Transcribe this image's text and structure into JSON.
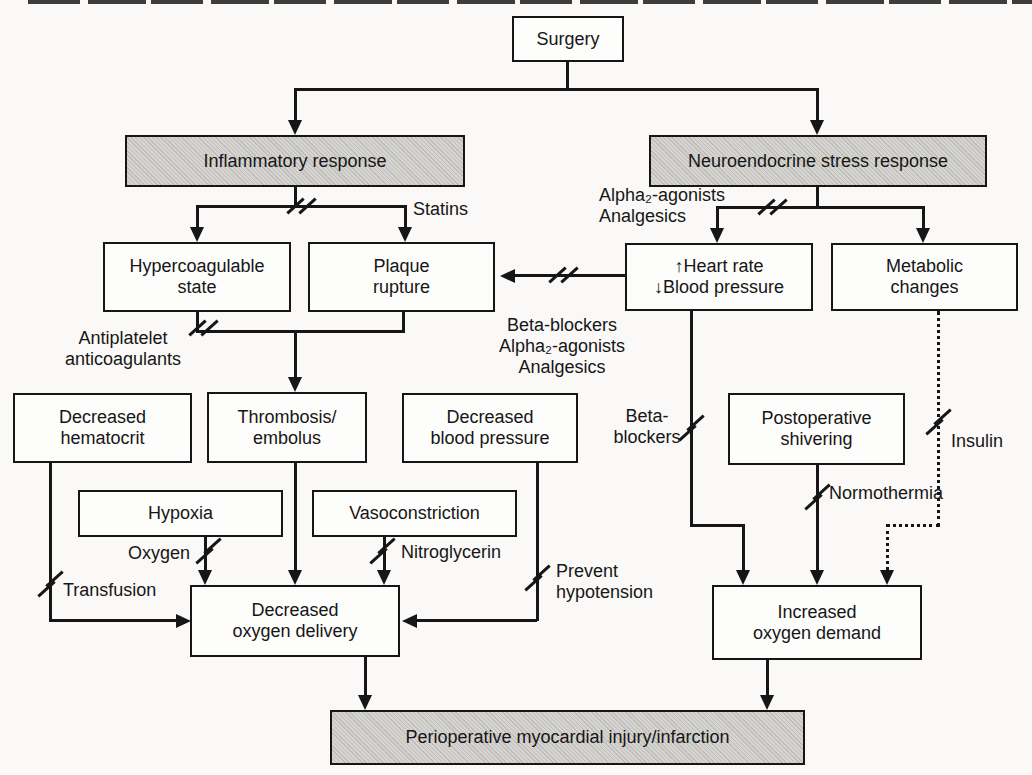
{
  "figure": {
    "type": "flowchart",
    "topic": "Pathways from surgery to perioperative myocardial injury/infarction with interventions",
    "colors": {
      "background": "#faf9f7",
      "line": "#161616",
      "plain_box_fill": "#fdfdfc",
      "shaded_box_fill": "#d5d4d1"
    }
  },
  "nodes": [
    {
      "id": "surgery",
      "lines": [
        "Surgery"
      ],
      "x": 512,
      "y": 16,
      "w": 112,
      "h": 46,
      "shaded": false
    },
    {
      "id": "inflammatory-response",
      "lines": [
        "Inflammatory response"
      ],
      "x": 125,
      "y": 135,
      "w": 340,
      "h": 52,
      "shaded": true
    },
    {
      "id": "neuroendocrine-stress-response",
      "lines": [
        "Neuroendocrine stress response"
      ],
      "x": 649,
      "y": 135,
      "w": 338,
      "h": 52,
      "shaded": true
    },
    {
      "id": "hypercoagulable-state",
      "lines": [
        "Hypercoagulable",
        "state"
      ],
      "x": 103,
      "y": 242,
      "w": 188,
      "h": 70,
      "shaded": false
    },
    {
      "id": "plaque-rupture",
      "lines": [
        "Plaque",
        "rupture"
      ],
      "x": 308,
      "y": 242,
      "w": 187,
      "h": 70,
      "shaded": false
    },
    {
      "id": "heart-rate-blood-pressure",
      "lines": [
        "↑Heart rate",
        "↓Blood pressure"
      ],
      "x": 625,
      "y": 243,
      "w": 188,
      "h": 68,
      "shaded": false
    },
    {
      "id": "metabolic-changes",
      "lines": [
        "Metabolic",
        "changes"
      ],
      "x": 831,
      "y": 243,
      "w": 187,
      "h": 68,
      "shaded": false
    },
    {
      "id": "decreased-hematocrit",
      "lines": [
        "Decreased",
        "hematocrit"
      ],
      "x": 13,
      "y": 393,
      "w": 179,
      "h": 70,
      "shaded": false
    },
    {
      "id": "thrombosis-embolus",
      "lines": [
        "Thrombosis/",
        "embolus"
      ],
      "x": 207,
      "y": 392,
      "w": 160,
      "h": 71,
      "shaded": false
    },
    {
      "id": "decreased-blood-pressure",
      "lines": [
        "Decreased",
        "blood pressure"
      ],
      "x": 402,
      "y": 393,
      "w": 176,
      "h": 70,
      "shaded": false
    },
    {
      "id": "postoperative-shivering",
      "lines": [
        "Postoperative",
        "shivering"
      ],
      "x": 728,
      "y": 393,
      "w": 177,
      "h": 72,
      "shaded": false
    },
    {
      "id": "hypoxia",
      "lines": [
        "Hypoxia"
      ],
      "x": 78,
      "y": 490,
      "w": 205,
      "h": 47,
      "shaded": false
    },
    {
      "id": "vasoconstriction",
      "lines": [
        "Vasoconstriction"
      ],
      "x": 312,
      "y": 490,
      "w": 205,
      "h": 47,
      "shaded": false
    },
    {
      "id": "decreased-oxygen-delivery",
      "lines": [
        "Decreased",
        "oxygen delivery"
      ],
      "x": 190,
      "y": 585,
      "w": 210,
      "h": 72,
      "shaded": false
    },
    {
      "id": "increased-oxygen-demand",
      "lines": [
        "Increased",
        "oxygen demand"
      ],
      "x": 712,
      "y": 585,
      "w": 210,
      "h": 75,
      "shaded": false
    },
    {
      "id": "perioperative-myocardial-injury",
      "lines": [
        "Perioperative myocardial injury/infarction"
      ],
      "x": 330,
      "y": 710,
      "w": 475,
      "h": 55,
      "shaded": true
    }
  ],
  "labels": [
    {
      "id": "statins-label",
      "lines": [
        "Statins"
      ],
      "x": 413,
      "y": 199,
      "align": "left"
    },
    {
      "id": "alpha2-agonists-analgesics-label",
      "lines": [
        "Alpha₂-agonists",
        "Analgesics"
      ],
      "x": 599,
      "y": 185,
      "align": "left"
    },
    {
      "id": "beta-blockers-combo-label",
      "lines": [
        "Beta-blockers",
        "Alpha₂-agonists",
        "Analgesics"
      ],
      "x": 562,
      "y": 315,
      "align": "center"
    },
    {
      "id": "antiplatelet-anticoagulants-label",
      "lines": [
        "Antiplatelet",
        "anticoagulants"
      ],
      "x": 123,
      "y": 328,
      "align": "center"
    },
    {
      "id": "beta-blockers-label",
      "lines": [
        "Beta-",
        "blockers"
      ],
      "x": 647,
      "y": 406,
      "align": "center"
    },
    {
      "id": "oxygen-label",
      "lines": [
        "Oxygen"
      ],
      "x": 190,
      "y": 543,
      "align": "right"
    },
    {
      "id": "transfusion-label",
      "lines": [
        "Transfusion"
      ],
      "x": 63,
      "y": 580,
      "align": "left"
    },
    {
      "id": "nitroglycerin-label",
      "lines": [
        "Nitroglycerin"
      ],
      "x": 401,
      "y": 542,
      "align": "left"
    },
    {
      "id": "prevent-hypotension-label",
      "lines": [
        "Prevent",
        "hypotension"
      ],
      "x": 556,
      "y": 561,
      "align": "left"
    },
    {
      "id": "insulin-label",
      "lines": [
        "Insulin"
      ],
      "x": 951,
      "y": 431,
      "align": "left"
    },
    {
      "id": "normothermia-label",
      "lines": [
        "Normothermia"
      ],
      "x": 829,
      "y": 483,
      "align": "left"
    }
  ],
  "segments": [
    {
      "x": 566,
      "y": 62,
      "len": 28,
      "d": "v"
    },
    {
      "x": 294,
      "y": 88,
      "len": 525,
      "d": "h"
    },
    {
      "x": 294,
      "y": 88,
      "len": 36,
      "d": "v"
    },
    {
      "x": 816,
      "y": 88,
      "len": 36,
      "d": "v"
    },
    {
      "x": 294,
      "y": 187,
      "len": 21,
      "d": "v"
    },
    {
      "x": 196,
      "y": 205,
      "len": 211,
      "d": "h"
    },
    {
      "x": 196,
      "y": 205,
      "len": 26,
      "d": "v"
    },
    {
      "x": 404,
      "y": 205,
      "len": 26,
      "d": "v"
    },
    {
      "x": 816,
      "y": 187,
      "len": 22,
      "d": "v"
    },
    {
      "x": 716,
      "y": 206,
      "len": 209,
      "d": "h"
    },
    {
      "x": 716,
      "y": 206,
      "len": 26,
      "d": "v"
    },
    {
      "x": 922,
      "y": 206,
      "len": 26,
      "d": "v"
    },
    {
      "x": 509,
      "y": 274,
      "len": 116,
      "d": "h"
    },
    {
      "x": 196,
      "y": 312,
      "len": 21,
      "d": "v"
    },
    {
      "x": 196,
      "y": 330,
      "len": 209,
      "d": "h"
    },
    {
      "x": 402,
      "y": 312,
      "len": 21,
      "d": "v"
    },
    {
      "x": 294,
      "y": 330,
      "len": 52,
      "d": "v"
    },
    {
      "x": 49,
      "y": 463,
      "len": 159,
      "d": "v"
    },
    {
      "x": 49,
      "y": 619,
      "len": 132,
      "d": "h"
    },
    {
      "x": 204,
      "y": 537,
      "len": 40,
      "d": "v"
    },
    {
      "x": 294,
      "y": 463,
      "len": 114,
      "d": "v"
    },
    {
      "x": 383,
      "y": 537,
      "len": 40,
      "d": "v"
    },
    {
      "x": 536,
      "y": 463,
      "len": 158,
      "d": "v"
    },
    {
      "x": 411,
      "y": 619,
      "len": 126,
      "d": "h"
    },
    {
      "x": 690,
      "y": 311,
      "len": 216,
      "d": "v"
    },
    {
      "x": 690,
      "y": 524,
      "len": 55,
      "d": "h"
    },
    {
      "x": 742,
      "y": 524,
      "len": 53,
      "d": "v"
    },
    {
      "x": 816,
      "y": 465,
      "len": 112,
      "d": "v"
    },
    {
      "x": 937,
      "y": 311,
      "len": 216,
      "d": "v",
      "dotted": true
    },
    {
      "x": 886,
      "y": 524,
      "len": 54,
      "d": "h",
      "dotted": true
    },
    {
      "x": 886,
      "y": 524,
      "len": 53,
      "d": "v",
      "dotted": true
    },
    {
      "x": 364,
      "y": 657,
      "len": 45,
      "d": "v"
    },
    {
      "x": 766,
      "y": 660,
      "len": 42,
      "d": "v"
    }
  ],
  "arrowheads": [
    {
      "x": 295,
      "y": 135,
      "dir": "down"
    },
    {
      "x": 817,
      "y": 135,
      "dir": "down"
    },
    {
      "x": 197,
      "y": 242,
      "dir": "down"
    },
    {
      "x": 405,
      "y": 242,
      "dir": "down"
    },
    {
      "x": 717,
      "y": 243,
      "dir": "down"
    },
    {
      "x": 923,
      "y": 243,
      "dir": "down"
    },
    {
      "x": 500,
      "y": 276,
      "dir": "left"
    },
    {
      "x": 295,
      "y": 392,
      "dir": "down"
    },
    {
      "x": 191,
      "y": 621,
      "dir": "right"
    },
    {
      "x": 205,
      "y": 585,
      "dir": "down"
    },
    {
      "x": 295,
      "y": 585,
      "dir": "down"
    },
    {
      "x": 384,
      "y": 585,
      "dir": "down"
    },
    {
      "x": 402,
      "y": 621,
      "dir": "left"
    },
    {
      "x": 743,
      "y": 585,
      "dir": "down"
    },
    {
      "x": 817,
      "y": 585,
      "dir": "down"
    },
    {
      "x": 887,
      "y": 585,
      "dir": "down"
    },
    {
      "x": 365,
      "y": 710,
      "dir": "down"
    },
    {
      "x": 767,
      "y": 710,
      "dir": "down"
    }
  ],
  "slashes": [
    {
      "x": 301,
      "y": 206,
      "o": "h"
    },
    {
      "x": 772,
      "y": 207,
      "o": "h"
    },
    {
      "x": 563,
      "y": 275,
      "o": "h"
    },
    {
      "x": 203,
      "y": 328,
      "o": "h"
    },
    {
      "x": 50,
      "y": 584,
      "o": "v"
    },
    {
      "x": 208,
      "y": 551,
      "o": "v"
    },
    {
      "x": 382,
      "y": 551,
      "o": "v"
    },
    {
      "x": 537,
      "y": 578,
      "o": "v"
    },
    {
      "x": 691,
      "y": 428,
      "o": "v"
    },
    {
      "x": 817,
      "y": 497,
      "o": "v"
    },
    {
      "x": 938,
      "y": 422,
      "o": "v"
    }
  ],
  "relationships": [
    {
      "from": "surgery",
      "to": "inflammatory-response"
    },
    {
      "from": "surgery",
      "to": "neuroendocrine-stress-response"
    },
    {
      "from": "inflammatory-response",
      "to": "hypercoagulable-state",
      "intervention": "Statins"
    },
    {
      "from": "inflammatory-response",
      "to": "plaque-rupture",
      "intervention": "Statins"
    },
    {
      "from": "neuroendocrine-stress-response",
      "to": "heart-rate-blood-pressure",
      "intervention": "Alpha₂-agonists, Analgesics"
    },
    {
      "from": "neuroendocrine-stress-response",
      "to": "metabolic-changes"
    },
    {
      "from": "heart-rate-blood-pressure",
      "to": "plaque-rupture",
      "intervention": "Beta-blockers, Alpha₂-agonists, Analgesics"
    },
    {
      "from": "hypercoagulable-state",
      "to": "thrombosis-embolus",
      "intervention": "Antiplatelet anticoagulants"
    },
    {
      "from": "plaque-rupture",
      "to": "thrombosis-embolus"
    },
    {
      "from": "decreased-hematocrit",
      "to": "decreased-oxygen-delivery",
      "intervention": "Transfusion"
    },
    {
      "from": "hypoxia",
      "to": "decreased-oxygen-delivery",
      "intervention": "Oxygen"
    },
    {
      "from": "thrombosis-embolus",
      "to": "decreased-oxygen-delivery"
    },
    {
      "from": "vasoconstriction",
      "to": "decreased-oxygen-delivery",
      "intervention": "Nitroglycerin"
    },
    {
      "from": "decreased-blood-pressure",
      "to": "decreased-oxygen-delivery",
      "intervention": "Prevent hypotension"
    },
    {
      "from": "heart-rate-blood-pressure",
      "to": "increased-oxygen-demand",
      "intervention": "Beta-blockers"
    },
    {
      "from": "postoperative-shivering",
      "to": "increased-oxygen-demand",
      "intervention": "Normothermia"
    },
    {
      "from": "metabolic-changes",
      "to": "increased-oxygen-demand",
      "intervention": "Insulin",
      "style": "dotted"
    },
    {
      "from": "decreased-oxygen-delivery",
      "to": "perioperative-myocardial-injury"
    },
    {
      "from": "increased-oxygen-demand",
      "to": "perioperative-myocardial-injury"
    }
  ]
}
